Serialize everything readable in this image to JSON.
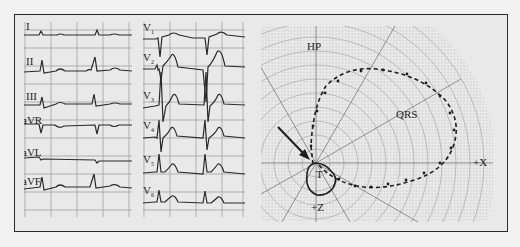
{
  "figure": {
    "background": "#f2f2f2",
    "frame_color": "#2a2a2a",
    "grid_color": "#9a9a9a",
    "trace_color": "#2a2a2a"
  },
  "limb_leads": {
    "labels": [
      "I",
      "II",
      "III",
      "aVR",
      "aVL",
      "aVF"
    ]
  },
  "chest_leads": {
    "labels": [
      "V1",
      "V2",
      "V3",
      "V4",
      "V5",
      "V6"
    ],
    "display": [
      {
        "main": "V",
        "sub": "1"
      },
      {
        "main": "V",
        "sub": "2"
      },
      {
        "main": "V",
        "sub": "3"
      },
      {
        "main": "V",
        "sub": "4"
      },
      {
        "main": "V",
        "sub": "5"
      },
      {
        "main": "V",
        "sub": "6"
      }
    ]
  },
  "vcg": {
    "plane_label": "HP",
    "qrs_label": "QRS",
    "t_label": "T",
    "x_axis_label": "+X",
    "z_axis_label": "+Z",
    "arrow": "pointing to QRS loop onset near origin"
  }
}
